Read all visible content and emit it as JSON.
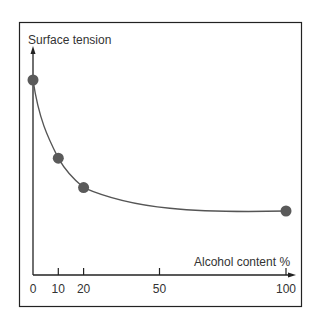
{
  "chart_data": {
    "type": "line",
    "title": "",
    "xlabel": "Alcohol content %",
    "ylabel": "Surface tension",
    "x_ticks": [
      0,
      10,
      20,
      50,
      100
    ],
    "x_tick_labels": [
      "0",
      "10",
      "20",
      "50",
      "100"
    ],
    "xlim": [
      0,
      100
    ],
    "y_ticks": [],
    "grid": false,
    "legend": null,
    "series": [
      {
        "name": "Surface tension",
        "x": [
          0,
          10,
          20,
          100
        ],
        "y": [
          1.0,
          0.6,
          0.45,
          0.33
        ],
        "markers": true,
        "smooth": true
      }
    ],
    "colors": {
      "line": "#555555",
      "marker": "#5a5a5a",
      "axis": "#222222",
      "frame": "#222222"
    }
  }
}
